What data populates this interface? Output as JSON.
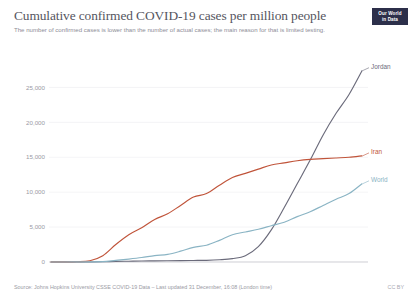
{
  "header": {
    "title": "Cumulative confirmed COVID-19 cases per million people",
    "subtitle": "The number of confirmed cases is lower than the number of actual cases; the main reason for that is limited testing.",
    "logo_line1": "Our World",
    "logo_line2": "in Data"
  },
  "footer": {
    "source": "Source: Johns Hopkins University CSSE COVID-19 Data – Last updated 31 December, 16:08 (London time)",
    "license": "CC BY"
  },
  "chart_data": {
    "type": "line",
    "title": "Cumulative confirmed COVID-19 cases per million people",
    "subtitle": "The number of confirmed cases is lower than the number of actual cases; the main reason for that is limited testing.",
    "xlabel": "",
    "ylabel": "",
    "grid": true,
    "legend_position": "right-inline-labels",
    "ylim": [
      0,
      27500
    ],
    "yticks": [
      0,
      5000,
      10000,
      15000,
      20000,
      25000
    ],
    "ytick_labels": [
      "0",
      "5,000",
      "10,000",
      "15,000",
      "20,000",
      "25,000"
    ],
    "xticks": [
      "Jan 22, 2020",
      "Mar 11",
      "Apr 30",
      "Jun 19",
      "Aug 8",
      "Sep 27",
      "Nov 16",
      "Dec 30, 2020"
    ],
    "x_domain": [
      "Jan 22, 2020",
      "Dec 30, 2020"
    ],
    "x": [
      "Jan 22, 2020",
      "Feb 11",
      "Mar 2",
      "Mar 11",
      "Mar 22",
      "Apr 11",
      "Apr 30",
      "May 20",
      "Jun 9",
      "Jun 19",
      "Jul 9",
      "Jul 29",
      "Aug 8",
      "Aug 28",
      "Sep 17",
      "Sep 27",
      "Oct 7",
      "Oct 17",
      "Oct 27",
      "Nov 6",
      "Nov 16",
      "Nov 26",
      "Dec 6",
      "Dec 16",
      "Dec 30, 2020"
    ],
    "series": [
      {
        "name": "Jordan",
        "color": "#6b6b7b",
        "label_color": "#6b6b7b",
        "values": [
          0,
          0,
          0,
          5,
          30,
          80,
          110,
          140,
          160,
          180,
          200,
          220,
          240,
          320,
          480,
          900,
          2200,
          4600,
          7800,
          11200,
          14600,
          18200,
          21300,
          24000,
          27400
        ]
      },
      {
        "name": "Iran",
        "color": "#c0543a",
        "label_color": "#c0543a",
        "values": [
          0,
          0,
          30,
          180,
          900,
          2500,
          3900,
          4900,
          6100,
          6900,
          8100,
          9300,
          9800,
          11000,
          12100,
          12700,
          13300,
          13900,
          14200,
          14500,
          14700,
          14800,
          14900,
          15000,
          15200
        ]
      },
      {
        "name": "World",
        "color": "#8ab4c4",
        "label_color": "#8ab4c4",
        "values": [
          0,
          5,
          12,
          20,
          45,
          230,
          420,
          640,
          920,
          1100,
          1550,
          2100,
          2400,
          3100,
          3900,
          4300,
          4700,
          5200,
          5700,
          6500,
          7200,
          8100,
          9000,
          9800,
          11200
        ]
      }
    ]
  }
}
